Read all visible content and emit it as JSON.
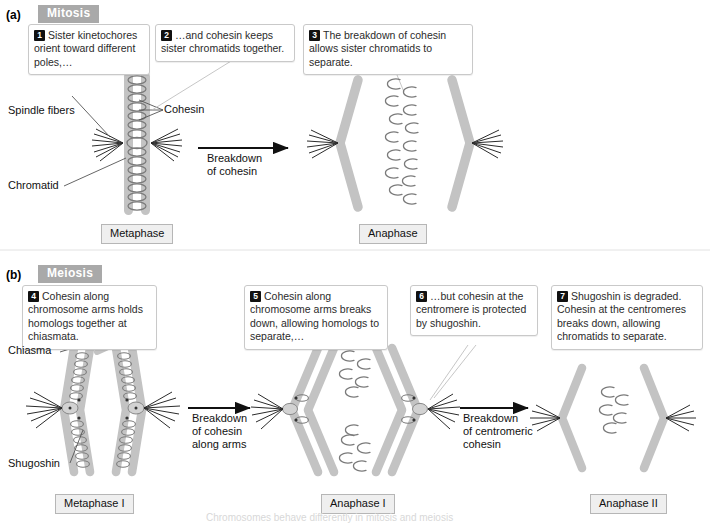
{
  "figure": {
    "panels": [
      {
        "letter": "(a)",
        "tag": "Mitosis"
      },
      {
        "letter": "(b)",
        "tag": "Meiosis"
      }
    ],
    "bottom_caption": "Chromosomes behave differently in mitosis and meiosis"
  },
  "callouts": [
    {
      "num": "1",
      "text": "Sister kinetochores orient toward different poles,…"
    },
    {
      "num": "2",
      "text": "…and cohesin keeps sister chromatids together."
    },
    {
      "num": "3",
      "text": "The breakdown of cohesin allows sister chromatids to separate."
    },
    {
      "num": "4",
      "text": "Cohesin along chromosome arms holds homologs together at chiasmata."
    },
    {
      "num": "5",
      "text": "Cohesin along chromosome arms breaks down, allowing homologs to separate,…"
    },
    {
      "num": "6",
      "text": "…but cohesin at the centromere is protected by shugoshin."
    },
    {
      "num": "7",
      "text": "Shugoshin is degraded. Cohesin at the centromeres breaks down, allowing chromatids to separate."
    }
  ],
  "leader_labels": [
    {
      "id": "spindle-fibers",
      "text": "Spindle fibers"
    },
    {
      "id": "cohesin",
      "text": "Cohesin"
    },
    {
      "id": "chromatid",
      "text": "Chromatid"
    },
    {
      "id": "chiasma",
      "text": "Chiasma"
    },
    {
      "id": "shugoshin",
      "text": "Shugoshin"
    }
  ],
  "arrow_captions": [
    {
      "id": "mitosis-arrow",
      "line1": "Breakdown",
      "line2": "of cohesin",
      "line3": ""
    },
    {
      "id": "meiosis-arrow-1",
      "line1": "Breakdown",
      "line2": "of cohesin",
      "line3": "along arms"
    },
    {
      "id": "meiosis-arrow-2",
      "line1": "Breakdown",
      "line2": "of centromeric",
      "line3": "cohesin"
    }
  ],
  "phases": [
    {
      "id": "metaphase",
      "label": "Metaphase"
    },
    {
      "id": "anaphase",
      "label": "Anaphase"
    },
    {
      "id": "metaphase-i",
      "label": "Metaphase I"
    },
    {
      "id": "anaphase-i",
      "label": "Anaphase I"
    },
    {
      "id": "anaphase-ii",
      "label": "Anaphase II"
    }
  ],
  "colors": {
    "chromosome_gray": "#c3c3c3",
    "chromosome_gray_dark": "#b0b0b0",
    "cohesin_outline": "#6e6e6e",
    "tag_background": "#a9a9a9",
    "phase_background": "#efefef",
    "callout_border": "#c9c9c9",
    "spindle": "#2b2b2b"
  }
}
